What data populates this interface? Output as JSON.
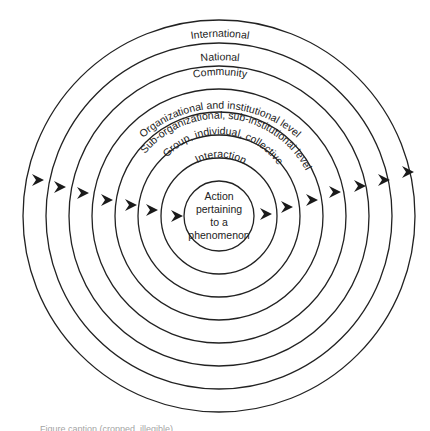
{
  "diagram": {
    "center": {
      "x": 219,
      "y": 216
    },
    "stroke_color": "#222222",
    "rings": [
      {
        "radius": 35,
        "label": "Action pertaining to a phenomenon"
      },
      {
        "radius": 58,
        "label": "Interaction"
      },
      {
        "radius": 81,
        "label": "Group, individual, collective"
      },
      {
        "radius": 104,
        "label": "Sub-organizational, sub-institutional level"
      },
      {
        "radius": 127,
        "label": "Organizational and institutional level"
      },
      {
        "radius": 150,
        "label": "Community"
      },
      {
        "radius": 173,
        "label": "National"
      },
      {
        "radius": 196,
        "label": "International"
      }
    ],
    "center_text": [
      "Action",
      "pertaining",
      "to a",
      "phenomenon"
    ],
    "labels": {
      "international": "International",
      "national": "National",
      "community": "Community",
      "organizational": "Organizational and institutional level",
      "sub_organizational": "Sub-organizational, sub-institutional level",
      "group": "Group, individual, collective",
      "interaction": "Interaction"
    },
    "arrows": {
      "direction": "left-to-right",
      "left_side_tips": [
        [
          44,
          180
        ],
        [
          66,
          187
        ],
        [
          89,
          193
        ],
        [
          113,
          200
        ],
        [
          137,
          205
        ],
        [
          158,
          210
        ],
        [
          183,
          216
        ]
      ],
      "right_side_tips": [
        [
          272,
          214
        ],
        [
          293,
          207
        ],
        [
          318,
          200
        ],
        [
          341,
          192
        ],
        [
          366,
          186
        ],
        [
          390,
          180
        ],
        [
          414,
          172
        ]
      ]
    }
  },
  "caption": {
    "text": "Figure caption (cropped, illegible)"
  }
}
